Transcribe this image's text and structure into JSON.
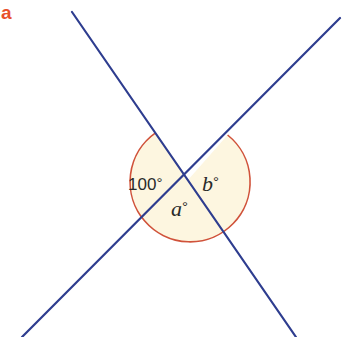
{
  "figure": {
    "part_label": "a",
    "colors": {
      "part_label": "#e8502a",
      "lines": "#2e3d8f",
      "arc": "#d0523a",
      "arc_fill": "#fdf6e0"
    },
    "intersection": {
      "x": 188,
      "y": 180
    },
    "lines": [
      {
        "name": "line-1",
        "x1": 72,
        "y1": 12,
        "x2": 296,
        "y2": 337
      },
      {
        "name": "line-2",
        "x1": 340,
        "y1": 18,
        "x2": 22,
        "y2": 337
      }
    ],
    "angles": [
      {
        "name": "left-angle",
        "value": "100",
        "unit": "°"
      },
      {
        "name": "bottom-angle",
        "variable": "a",
        "unit": "°"
      },
      {
        "name": "right-angle",
        "variable": "b",
        "unit": "°"
      }
    ]
  }
}
